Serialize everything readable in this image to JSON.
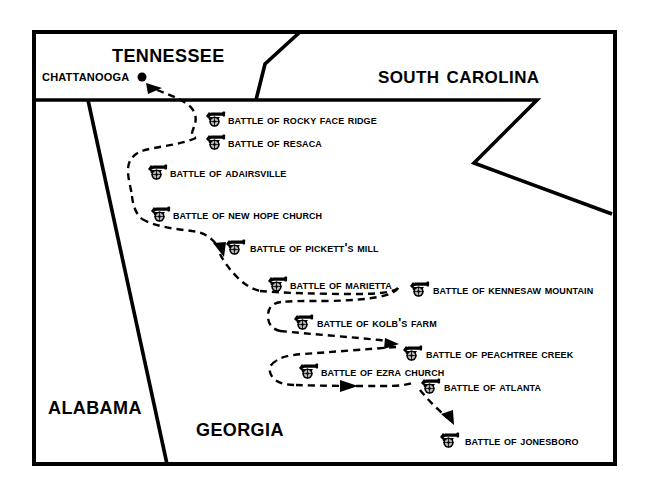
{
  "map": {
    "title": "Atlanta Campaign Battles Map",
    "background_color": "#ffffff",
    "line_color": "#000000",
    "frame": {
      "x": 32,
      "y": 30,
      "width": 585,
      "height": 436,
      "stroke_width": 4
    },
    "states": [
      {
        "name": "Tennessee",
        "label": "Tennessee",
        "x": 112,
        "y": 41,
        "size": "large"
      },
      {
        "name": "South Carolina",
        "label": "South Carolina",
        "x": 378,
        "y": 63,
        "size": "large"
      },
      {
        "name": "Alabama",
        "label": "Alabama",
        "x": 48,
        "y": 393,
        "size": "large"
      },
      {
        "name": "Georgia",
        "label": "Georgia",
        "x": 196,
        "y": 415,
        "size": "large"
      }
    ],
    "cities": [
      {
        "name": "Chattanooga",
        "label": "Chattanooga",
        "label_x": 42,
        "label_y": 68,
        "dot_x": 142,
        "dot_y": 77,
        "dot_r": 4.5
      }
    ],
    "route": {
      "style": "dashed",
      "dash_pattern": "7,5",
      "stroke_width": 2.4,
      "description": "Sherman's Atlanta Campaign advance from Chattanooga to Jonesboro"
    },
    "battles": [
      {
        "id": "rocky-face-ridge",
        "label": "Battle of Rocky Face Ridge",
        "cannon_x": 203,
        "cannon_y": 109,
        "label_x": 228,
        "label_y": 114
      },
      {
        "id": "resaca",
        "label": "Battle of Resaca",
        "cannon_x": 203,
        "cannon_y": 132,
        "label_x": 228,
        "label_y": 137
      },
      {
        "id": "adairsville",
        "label": "Battle of Adairsville",
        "cannon_x": 145,
        "cannon_y": 162,
        "label_x": 170,
        "label_y": 167
      },
      {
        "id": "new-hope-church",
        "label": "Battle of New Hope Church",
        "cannon_x": 148,
        "cannon_y": 204,
        "label_x": 173,
        "label_y": 209
      },
      {
        "id": "picketts-mill",
        "label": "Battle of Pickett's Mill",
        "cannon_x": 223,
        "cannon_y": 237,
        "label_x": 250,
        "label_y": 242
      },
      {
        "id": "marietta",
        "label": "Battle of Marietta",
        "cannon_x": 265,
        "cannon_y": 274,
        "label_x": 290,
        "label_y": 279
      },
      {
        "id": "kennesaw-mountain",
        "label": "Battle of Kennesaw Mountain",
        "cannon_x": 407,
        "cannon_y": 279,
        "label_x": 433,
        "label_y": 284
      },
      {
        "id": "kolbs-farm",
        "label": "Battle of Kolb's Farm",
        "cannon_x": 291,
        "cannon_y": 312,
        "label_x": 317,
        "label_y": 317
      },
      {
        "id": "peachtree-creek",
        "label": "Battle of Peachtree Creek",
        "cannon_x": 400,
        "cannon_y": 343,
        "label_x": 426,
        "label_y": 348
      },
      {
        "id": "ezra-church",
        "label": "Battle of Ezra Church",
        "cannon_x": 296,
        "cannon_y": 361,
        "label_x": 321,
        "label_y": 366
      },
      {
        "id": "atlanta",
        "label": "Battle of Atlanta",
        "cannon_x": 418,
        "cannon_y": 376,
        "label_x": 444,
        "label_y": 381
      },
      {
        "id": "jonesboro",
        "label": "Battle of Jonesboro",
        "cannon_x": 437,
        "cannon_y": 430,
        "label_x": 465,
        "label_y": 435
      }
    ],
    "borders": [
      {
        "name": "tennessee-georgia-border",
        "points": "32,100 474,100"
      },
      {
        "name": "tennessee-north-carolina-border",
        "points": "256,100 265,64 306,30"
      },
      {
        "name": "georgia-south-carolina-border",
        "points": "474,100 537,100 474,163 612,214"
      },
      {
        "name": "alabama-georgia-border",
        "points": "88,100 165,466"
      }
    ],
    "icons": {
      "cannon": "cannon-icon",
      "city_dot": "city-dot-icon",
      "arrowhead": "arrowhead-icon"
    }
  }
}
